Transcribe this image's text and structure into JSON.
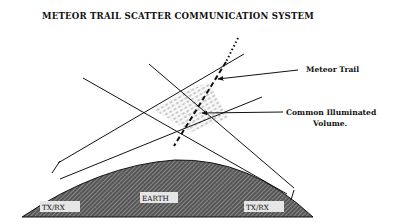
{
  "title": "METEOR TRAIL SCATTER COMMUNICATION SYSTEM",
  "labels": {
    "meteor_trail": "Meteor Trail",
    "volume_line1": "Common Illuminated",
    "volume_line2": "Volume.",
    "earth": "EARTH",
    "station_left": "TX/RX",
    "station_right": "TX/RX"
  },
  "colors": {
    "ink": "#111111",
    "earth_fill": "#555555",
    "earth_hatch": "#bbbbbb",
    "label_box": "#e6e6e6"
  }
}
